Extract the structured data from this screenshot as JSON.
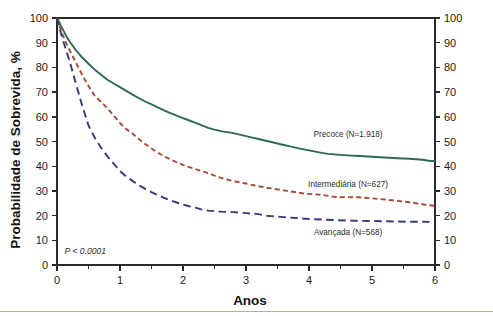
{
  "chart_data": {
    "type": "line",
    "title": "",
    "subtitle": "",
    "xlabel": "Anos",
    "ylabel": "Probabilidade de Sobrevida, %",
    "ylabel_right": "",
    "xlim": [
      0,
      6
    ],
    "ylim": [
      0,
      100
    ],
    "grid": false,
    "legend_position": "inline-right",
    "x_ticks": [
      0,
      1,
      2,
      3,
      4,
      5,
      6
    ],
    "x_tick_labels": [
      "0",
      "1",
      "2",
      "3",
      "4",
      "5",
      "6"
    ],
    "x_minor_ticks": [
      0.5,
      1.5,
      2.5,
      3.5,
      4.5,
      5.5
    ],
    "y_ticks": [
      0,
      10,
      20,
      30,
      40,
      50,
      60,
      70,
      80,
      90,
      100
    ],
    "y_tick_labels": [
      "0",
      "10",
      "20",
      "30",
      "40",
      "50",
      "60",
      "70",
      "80",
      "90",
      "100"
    ],
    "y_ticks_right": [
      0,
      10,
      20,
      30,
      40,
      50,
      60,
      70,
      80,
      90,
      100
    ],
    "y_tick_labels_right": [
      "0",
      "10",
      "20",
      "30",
      "40",
      "50",
      "60",
      "70",
      "80",
      "90",
      "100"
    ],
    "annotations": [
      {
        "name": "p-value",
        "text": "P < 0.0001",
        "x": 0.12,
        "y": 4.5
      }
    ],
    "series": [
      {
        "name": "Precoce",
        "label": "Precoce (N=1.918)",
        "n": "1.918",
        "color": "#2c6b4f",
        "style": "solid",
        "label_x": 4.62,
        "label_y": 52.0,
        "x": [
          0,
          0.05,
          0.1,
          0.15,
          0.2,
          0.3,
          0.4,
          0.5,
          0.6,
          0.7,
          0.8,
          0.9,
          1.0,
          1.1,
          1.2,
          1.3,
          1.4,
          1.5,
          1.6,
          1.7,
          1.8,
          1.9,
          2.0,
          2.1,
          2.2,
          2.3,
          2.4,
          2.5,
          2.6,
          2.7,
          2.8,
          2.9,
          3.0,
          3.1,
          3.2,
          3.3,
          3.4,
          3.5,
          3.6,
          3.7,
          3.8,
          3.9,
          4.0,
          4.1,
          4.2,
          4.3,
          4.4,
          4.5,
          4.6,
          4.8,
          5.0,
          5.2,
          5.4,
          5.6,
          5.8,
          5.9,
          6.0
        ],
        "y": [
          100,
          97.5,
          95.0,
          92.5,
          90.5,
          87.0,
          84.0,
          81.5,
          79.0,
          77.0,
          75.0,
          73.5,
          72.0,
          70.5,
          69.0,
          67.5,
          66.2,
          65.0,
          63.8,
          62.6,
          61.5,
          60.5,
          59.5,
          58.5,
          57.5,
          56.5,
          55.5,
          54.8,
          54.2,
          53.8,
          53.4,
          52.8,
          52.2,
          51.6,
          51.0,
          50.4,
          49.8,
          49.2,
          48.6,
          48.0,
          47.4,
          46.9,
          46.4,
          45.9,
          45.4,
          45.0,
          44.8,
          44.6,
          44.4,
          44.1,
          43.8,
          43.5,
          43.2,
          43.0,
          42.6,
          42.2,
          42.0
        ]
      },
      {
        "name": "Intermediária",
        "label": "Intermediária (N=627)",
        "n": "627",
        "color": "#a84a32",
        "style": "dashed",
        "label_x": 4.62,
        "label_y": 31.5,
        "x": [
          0,
          0.05,
          0.1,
          0.15,
          0.2,
          0.3,
          0.4,
          0.5,
          0.6,
          0.7,
          0.8,
          0.9,
          1.0,
          1.1,
          1.2,
          1.3,
          1.4,
          1.5,
          1.6,
          1.7,
          1.8,
          1.9,
          2.0,
          2.1,
          2.2,
          2.3,
          2.4,
          2.5,
          2.6,
          2.7,
          2.8,
          2.9,
          3.0,
          3.1,
          3.2,
          3.3,
          3.4,
          3.5,
          3.6,
          3.7,
          3.8,
          3.9,
          4.0,
          4.2,
          4.4,
          4.5,
          4.6,
          4.8,
          5.0,
          5.2,
          5.4,
          5.6,
          5.8,
          5.9,
          6.0
        ],
        "y": [
          100,
          96.0,
          92.5,
          89.5,
          87.0,
          82.0,
          77.0,
          72.5,
          68.5,
          66.0,
          63.5,
          60.5,
          57.5,
          55.0,
          53.2,
          51.0,
          49.0,
          47.2,
          45.5,
          44.0,
          42.8,
          41.6,
          40.5,
          39.6,
          38.8,
          38.0,
          37.2,
          36.2,
          35.3,
          34.6,
          34.0,
          33.5,
          33.0,
          32.4,
          31.9,
          31.4,
          31.0,
          30.6,
          30.2,
          29.8,
          29.4,
          29.0,
          28.8,
          28.4,
          27.6,
          27.4,
          27.5,
          27.4,
          27.0,
          26.5,
          26.0,
          25.4,
          24.6,
          24.2,
          24.0
        ]
      },
      {
        "name": "Avançada",
        "label": "Avançada (N=568)",
        "n": "568",
        "color": "#333b7a",
        "style": "dashed-long",
        "label_x": 4.62,
        "label_y": 12.0,
        "x": [
          0,
          0.05,
          0.1,
          0.15,
          0.2,
          0.25,
          0.3,
          0.35,
          0.4,
          0.45,
          0.5,
          0.6,
          0.7,
          0.8,
          0.9,
          1.0,
          1.1,
          1.2,
          1.3,
          1.4,
          1.5,
          1.6,
          1.7,
          1.8,
          1.9,
          2.0,
          2.1,
          2.2,
          2.3,
          2.4,
          2.5,
          2.6,
          2.7,
          2.8,
          2.9,
          3.0,
          3.1,
          3.2,
          3.3,
          3.4,
          3.5,
          3.6,
          3.8,
          4.0,
          4.2,
          4.4,
          4.6,
          4.8,
          5.0,
          5.2,
          5.4,
          5.6,
          5.8,
          6.0
        ],
        "y": [
          100,
          95.0,
          90.5,
          86.5,
          82.5,
          78.0,
          73.5,
          69.0,
          64.5,
          60.5,
          56.5,
          51.5,
          47.5,
          44.0,
          41.0,
          38.0,
          35.8,
          34.0,
          32.3,
          30.8,
          29.5,
          28.3,
          27.2,
          26.2,
          25.3,
          24.5,
          23.8,
          23.2,
          22.4,
          22.0,
          21.8,
          21.6,
          21.5,
          21.4,
          21.2,
          21.0,
          20.8,
          20.6,
          20.0,
          19.8,
          19.6,
          19.4,
          19.0,
          18.6,
          18.4,
          18.2,
          18.0,
          17.9,
          17.8,
          17.7,
          17.6,
          17.5,
          17.5,
          17.4
        ]
      }
    ]
  }
}
